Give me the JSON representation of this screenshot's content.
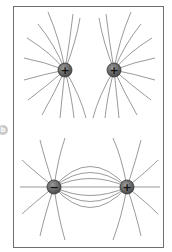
{
  "figure": {
    "side_label": "b",
    "panels": [
      {
        "id": "top",
        "title": "Two positive charges",
        "charges": [
          {
            "sign": "+",
            "x": 65,
            "y": 70
          },
          {
            "sign": "+",
            "x": 114,
            "y": 70
          }
        ]
      },
      {
        "id": "bottom",
        "title": "Negative and positive charge (dipole)",
        "charges": [
          {
            "sign": "−",
            "x": 54,
            "y": 187
          },
          {
            "sign": "+",
            "x": 127,
            "y": 187
          }
        ]
      }
    ]
  },
  "colors": {
    "charge_fill": "#6a6a6a",
    "charge_rim": "#3a3a3a",
    "field_line": "#555555",
    "frame": "#6e6e6e"
  }
}
